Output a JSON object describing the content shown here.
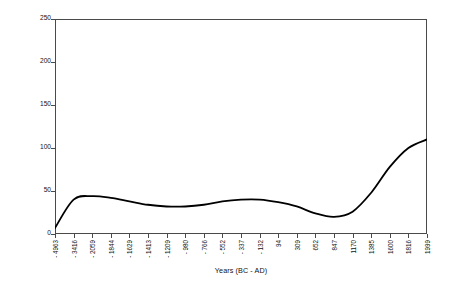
{
  "chart_data": {
    "type": "line",
    "title": "",
    "xlabel": "Years (BC - AD)",
    "ylabel": "Arboreal/NonArboreal Pollen %",
    "ylim": [
      0,
      250
    ],
    "y_ticks": [
      0,
      50,
      100,
      150,
      200,
      250
    ],
    "grid": false,
    "legend": "none",
    "line_color": "#000000",
    "axis_color": "#4a4a4a",
    "categories": [
      "- 4963",
      "- 3416",
      "- 2059",
      "- 1844",
      "- 1629",
      "- 1413",
      "- 1209",
      "- 980",
      "- 766",
      "- 552",
      "- 337",
      "- 132",
      "94",
      "309",
      "652",
      "847",
      "1170",
      "1385",
      "1600",
      "1816",
      "1999"
    ],
    "x": [
      -4963,
      -3416,
      -2059,
      -1844,
      -1629,
      -1413,
      -1209,
      -980,
      -766,
      -552,
      -337,
      -132,
      94,
      309,
      652,
      847,
      1170,
      1385,
      1600,
      1816,
      1999
    ],
    "values": [
      7,
      40,
      44,
      42,
      38,
      34,
      32,
      32,
      34,
      38,
      40,
      40,
      37,
      32,
      24,
      20,
      26,
      48,
      78,
      100,
      110
    ],
    "series": [
      {
        "name": "Arboreal/NonArboreal Pollen %",
        "values": [
          7,
          40,
          44,
          42,
          38,
          34,
          32,
          32,
          34,
          38,
          40,
          40,
          37,
          32,
          24,
          20,
          26,
          48,
          78,
          100,
          110
        ]
      }
    ],
    "annotations": []
  }
}
